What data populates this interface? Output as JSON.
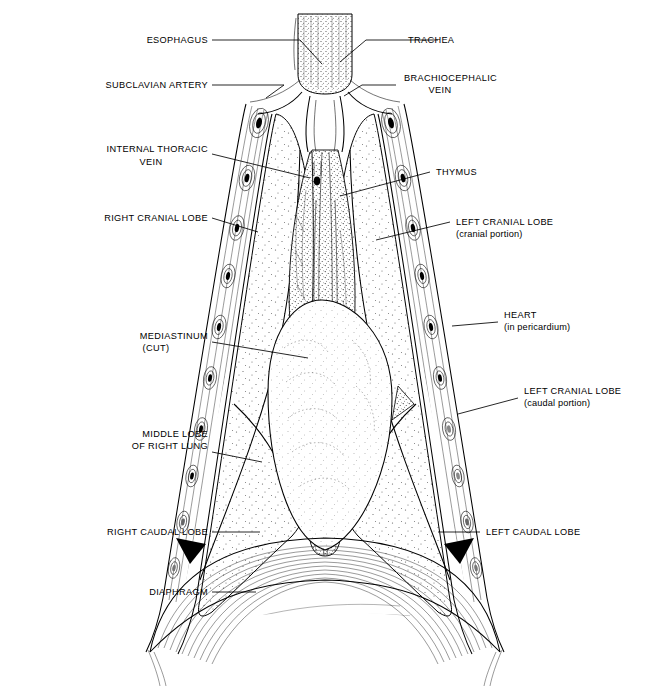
{
  "figure": {
    "ink_color": "#000000",
    "background_color": "#ffffff"
  },
  "labels": {
    "esophagus": {
      "line1": "ESOPHAGUS"
    },
    "trachea": {
      "line1": "TRACHEA"
    },
    "subclavian_artery": {
      "line1": "SUBCLAVIAN ARTERY"
    },
    "brachiocephalic_vein": {
      "line1": "BRACHIOCEPHALIC",
      "line2": "VEIN"
    },
    "internal_thoracic_vein": {
      "line1": "INTERNAL THORACIC",
      "line2": "VEIN"
    },
    "thymus": {
      "line1": "THYMUS"
    },
    "right_cranial_lobe": {
      "line1": "RIGHT CRANIAL LOBE"
    },
    "left_cranial_lobe_cranial": {
      "line1": "LEFT CRANIAL LOBE",
      "line2": "(cranial portion)"
    },
    "heart": {
      "line1": "HEART",
      "line2": "(in pericardium)"
    },
    "mediastinum": {
      "line1": "MEDIASTINUM",
      "line2": "(CUT)"
    },
    "left_cranial_lobe_caudal": {
      "line1": "LEFT CRANIAL LOBE",
      "line2": "(caudal portion)"
    },
    "middle_lobe_right_lung": {
      "line1": "MIDDLE LOBE",
      "line2": "OF RIGHT LUNG"
    },
    "right_caudal_lobe": {
      "line1": "RIGHT CAUDAL LOBE"
    },
    "left_caudal_lobe": {
      "line1": "LEFT CAUDAL LOBE"
    },
    "diaphragm": {
      "line1": "DIAPHRAGM"
    }
  },
  "structures": {
    "trachea": "trachea",
    "esophagus": "esophagus",
    "thymus": "thymus",
    "heart": "heart-in-pericardium",
    "mediastinum": "mediastinum-cut",
    "diaphragm": "diaphragm",
    "chest_wall": "cut-chest-wall-with-ribs",
    "right_lung_lobes": [
      "right cranial lobe",
      "middle lobe of right lung",
      "right caudal lobe"
    ],
    "left_lung_lobes": [
      "left cranial lobe (cranial portion)",
      "left cranial lobe (caudal portion)",
      "left caudal lobe"
    ]
  }
}
